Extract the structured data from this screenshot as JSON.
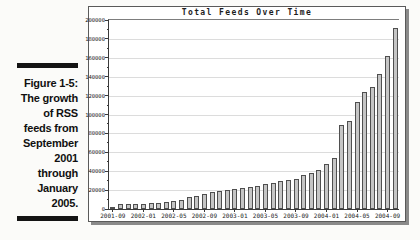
{
  "figure": {
    "label": "Figure 1-5:",
    "caption_lines": [
      "The growth",
      "of RSS",
      "feeds from",
      "September",
      "2001",
      "through",
      "January",
      "2005."
    ]
  },
  "chart_data": {
    "type": "bar",
    "title": "Total Feeds Over Time",
    "xlabel": "",
    "ylabel": "",
    "ylim": [
      0,
      200000
    ],
    "ytick_step": 20000,
    "ytick_labels": [
      "0",
      "20000",
      "40000",
      "60000",
      "80000",
      "100000",
      "120000",
      "140000",
      "160000",
      "180000",
      "200000"
    ],
    "xtick_every": 4,
    "xtick_shown": [
      "2001-09",
      "2002-01",
      "2002-05",
      "2002-09",
      "2003-01",
      "2003-05",
      "2003-09",
      "2004-01",
      "2004-05",
      "2004-09"
    ],
    "grid": true,
    "legend": false,
    "categories": [
      "2001-09",
      "2001-10",
      "2001-11",
      "2001-12",
      "2002-01",
      "2002-02",
      "2002-03",
      "2002-04",
      "2002-05",
      "2002-06",
      "2002-07",
      "2002-08",
      "2002-09",
      "2002-10",
      "2002-11",
      "2002-12",
      "2003-01",
      "2003-02",
      "2003-03",
      "2003-04",
      "2003-05",
      "2003-06",
      "2003-07",
      "2003-08",
      "2003-09",
      "2003-10",
      "2003-11",
      "2003-12",
      "2004-01",
      "2004-02",
      "2004-03",
      "2004-04",
      "2004-05",
      "2004-06",
      "2004-07",
      "2004-08",
      "2004-09",
      "2004-10"
    ],
    "values": [
      2500,
      4800,
      5300,
      5800,
      5800,
      6100,
      6400,
      7000,
      8800,
      9400,
      12300,
      13400,
      15400,
      18300,
      19400,
      20300,
      21000,
      21900,
      23300,
      24800,
      26300,
      27200,
      29400,
      30400,
      32000,
      35500,
      38000,
      41500,
      48000,
      54000,
      89000,
      93500,
      113000,
      124000,
      129500,
      143000,
      162000,
      192000
    ]
  },
  "colors": {
    "page_bg": "#fbfbf9",
    "chart_bg": "#ffffff",
    "bar_fill": "#c5c5c5",
    "bar_border": "#4f4f4f",
    "grid_line": "#dcdcdc",
    "axis": "#3a3a3a",
    "shadow": "#8a8a8a",
    "caption_rule": "#141414"
  }
}
